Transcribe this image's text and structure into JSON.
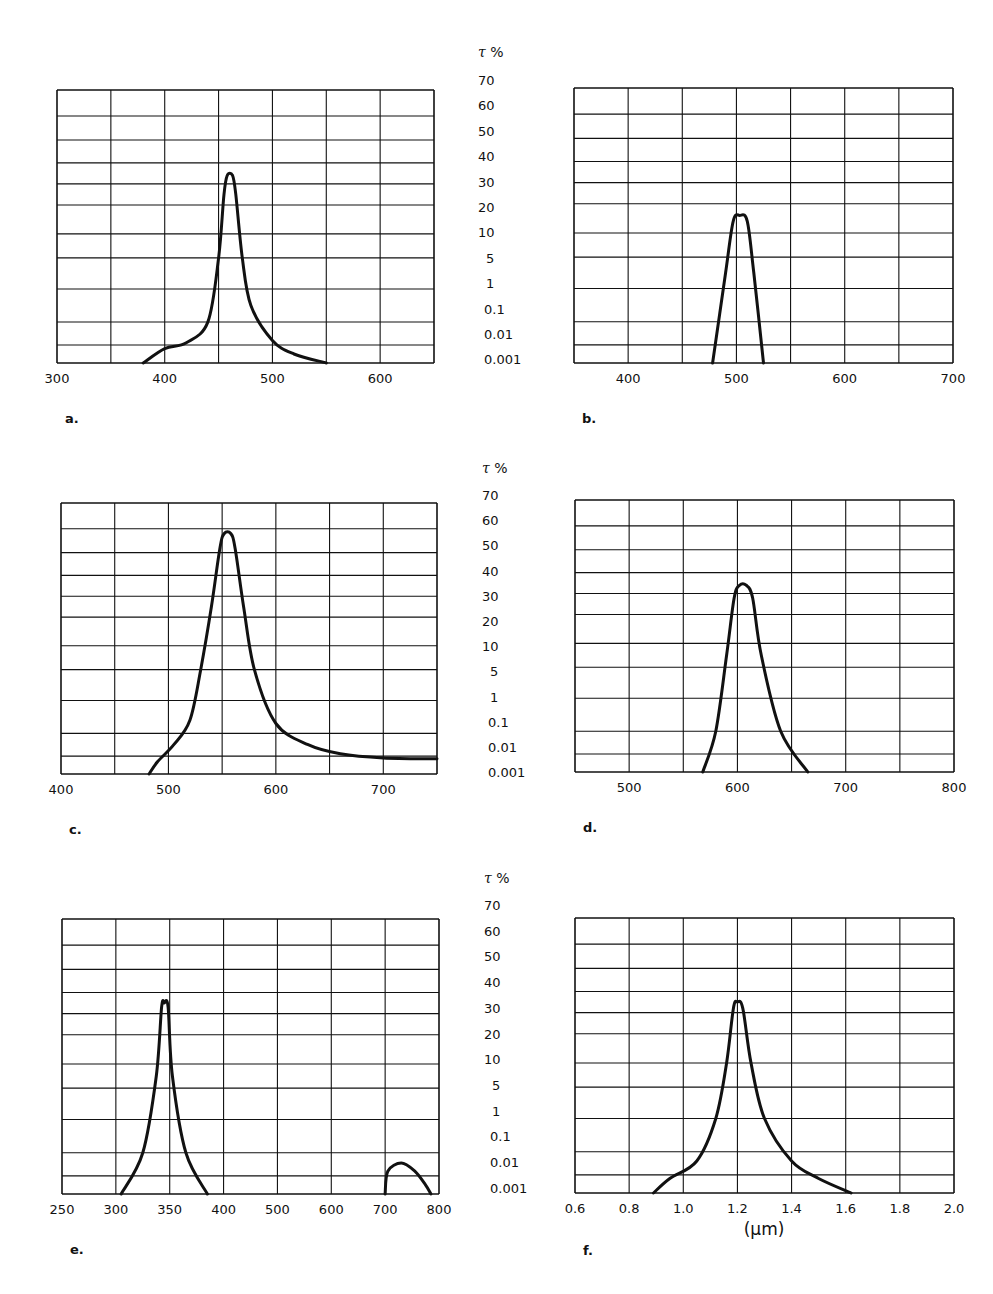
{
  "figure": {
    "y_axis_header": {
      "symbol": "τ",
      "unit": "%"
    },
    "y_axis_labels": [
      "70",
      "60",
      "50",
      "40",
      "30",
      "20",
      "10",
      "5",
      "1",
      "0.1",
      "0.01",
      "0.001"
    ],
    "grid_level_fractions": [
      0,
      0.066,
      0.15,
      0.271,
      0.385,
      0.473,
      0.579,
      0.656,
      0.733,
      0.817,
      0.905,
      1.0
    ],
    "line_color": "#111111",
    "f_unit_label": "(μm)"
  },
  "chart_data": [
    {
      "id": "a",
      "label": "a.",
      "type": "line",
      "title": "",
      "xlabel": "wavelength (nm)",
      "ylabel": "τ %",
      "xlim": [
        300,
        650
      ],
      "x_ticks": [
        300,
        400,
        500,
        600
      ],
      "y_ticks": [
        "0.001",
        "0.01",
        "0.1",
        "1",
        "5",
        "10",
        "20",
        "30",
        "40",
        "50",
        "60",
        "70"
      ],
      "grid": true,
      "peak_wavelength": 460,
      "peak_transmittance_pct": 32,
      "points": [
        [
          380,
          0
        ],
        [
          400,
          0.8
        ],
        [
          420,
          1.1
        ],
        [
          440,
          2.0
        ],
        [
          450,
          4
        ],
        [
          455,
          6.5
        ],
        [
          458,
          7.4
        ],
        [
          463,
          7.4
        ],
        [
          466,
          6.5
        ],
        [
          472,
          4
        ],
        [
          480,
          2.5
        ],
        [
          500,
          1.2
        ],
        [
          520,
          0.5
        ],
        [
          550,
          0
        ]
      ]
    },
    {
      "id": "b",
      "label": "b.",
      "type": "line",
      "title": "",
      "xlabel": "wavelength (nm)",
      "ylabel": "τ %",
      "xlim": [
        350,
        700
      ],
      "x_ticks": [
        400,
        500,
        600,
        700
      ],
      "grid": true,
      "peak_wavelength": 505,
      "peak_transmittance_pct": 12,
      "points": [
        [
          478,
          0
        ],
        [
          490,
          3.5
        ],
        [
          497,
          5.4
        ],
        [
          503,
          5.6
        ],
        [
          510,
          5.4
        ],
        [
          516,
          3.5
        ],
        [
          525,
          0
        ]
      ]
    },
    {
      "id": "c",
      "label": "c.",
      "type": "line",
      "title": "",
      "xlabel": "wavelength (nm)",
      "ylabel": "τ %",
      "xlim": [
        400,
        750
      ],
      "x_ticks": [
        400,
        500,
        600,
        700
      ],
      "grid": true,
      "peak_wavelength": 555,
      "peak_transmittance_pct": 55,
      "points": [
        [
          482,
          0
        ],
        [
          490,
          0.7
        ],
        [
          505,
          1.5
        ],
        [
          520,
          2.4
        ],
        [
          530,
          4
        ],
        [
          540,
          6.5
        ],
        [
          548,
          9.2
        ],
        [
          552,
          9.8
        ],
        [
          558,
          9.8
        ],
        [
          562,
          9.2
        ],
        [
          570,
          6.5
        ],
        [
          580,
          4
        ],
        [
          600,
          2.3
        ],
        [
          630,
          1.5
        ],
        [
          660,
          1.1
        ],
        [
          700,
          0.9
        ],
        [
          750,
          0.85
        ]
      ]
    },
    {
      "id": "d",
      "label": "d.",
      "type": "line",
      "title": "",
      "xlabel": "wavelength (nm)",
      "ylabel": "τ %",
      "xlim": [
        450,
        800
      ],
      "x_ticks": [
        500,
        600,
        700,
        800
      ],
      "grid": true,
      "peak_wavelength": 605,
      "peak_transmittance_pct": 33,
      "points": [
        [
          568,
          0
        ],
        [
          580,
          2
        ],
        [
          590,
          4.5
        ],
        [
          597,
          6.8
        ],
        [
          602,
          7.4
        ],
        [
          608,
          7.4
        ],
        [
          614,
          6.8
        ],
        [
          622,
          4.5
        ],
        [
          640,
          2
        ],
        [
          665,
          0
        ]
      ]
    },
    {
      "id": "e",
      "label": "e.",
      "type": "line",
      "title": "",
      "xlabel": "wavelength (nm)",
      "ylabel": "τ %",
      "x_scale": "gridline-index",
      "xlim": [
        0,
        7
      ],
      "x_ticks": [
        250,
        300,
        350,
        400,
        500,
        600,
        700,
        800
      ],
      "grid": true,
      "peak_wavelength": 345,
      "peak_transmittance_pct": 32,
      "secondary_peak_wavelength": 725,
      "secondary_peak_transmittance_pct": 0.005,
      "points": [
        [
          1.1,
          0
        ],
        [
          1.5,
          2
        ],
        [
          1.75,
          4.5
        ],
        [
          1.85,
          7.3
        ],
        [
          1.9,
          7.5
        ],
        [
          1.97,
          7.3
        ],
        [
          2.05,
          4.5
        ],
        [
          2.3,
          2
        ],
        [
          2.7,
          0
        ]
      ],
      "points2": [
        [
          6.0,
          0
        ],
        [
          6.05,
          1.2
        ],
        [
          6.3,
          1.55
        ],
        [
          6.55,
          1.2
        ],
        [
          6.75,
          0.5
        ],
        [
          6.85,
          0
        ]
      ]
    },
    {
      "id": "f",
      "label": "f.",
      "type": "line",
      "title": "",
      "xlabel": "(μm)",
      "ylabel": "τ %",
      "xlim": [
        0.6,
        2.0
      ],
      "x_ticks": [
        "0.6",
        "0.8",
        "1.0",
        "1.2",
        "1.4",
        "1.6",
        "1.8",
        "2.0"
      ],
      "grid": true,
      "peak_wavelength": 1.2,
      "peak_transmittance_pct": 33,
      "points": [
        [
          0.89,
          0
        ],
        [
          0.95,
          0.8
        ],
        [
          1.05,
          1.6
        ],
        [
          1.12,
          3
        ],
        [
          1.16,
          5
        ],
        [
          1.185,
          7.2
        ],
        [
          1.2,
          7.5
        ],
        [
          1.22,
          7.2
        ],
        [
          1.25,
          5
        ],
        [
          1.3,
          3
        ],
        [
          1.4,
          1.6
        ],
        [
          1.5,
          0.8
        ],
        [
          1.62,
          0
        ]
      ]
    }
  ]
}
